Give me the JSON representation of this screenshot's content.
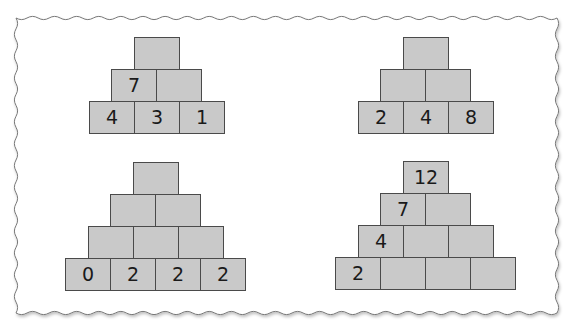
{
  "puzzle": {
    "title": "Number pyramids",
    "cell_color": "#c9c9c9",
    "border_color": "#4a4a4a",
    "pyramids": [
      {
        "id": "top-left",
        "rows": [
          [
            ""
          ],
          [
            "7",
            ""
          ],
          [
            "4",
            "3",
            "1"
          ]
        ]
      },
      {
        "id": "top-right",
        "rows": [
          [
            ""
          ],
          [
            "",
            ""
          ],
          [
            "2",
            "4",
            "8"
          ]
        ]
      },
      {
        "id": "bottom-left",
        "rows": [
          [
            ""
          ],
          [
            "",
            ""
          ],
          [
            "",
            "",
            ""
          ],
          [
            "0",
            "2",
            "2",
            "2"
          ]
        ]
      },
      {
        "id": "bottom-right",
        "rows": [
          [
            "12"
          ],
          [
            "7",
            ""
          ],
          [
            "4",
            "",
            ""
          ],
          [
            "2",
            "",
            "",
            ""
          ]
        ]
      }
    ]
  }
}
